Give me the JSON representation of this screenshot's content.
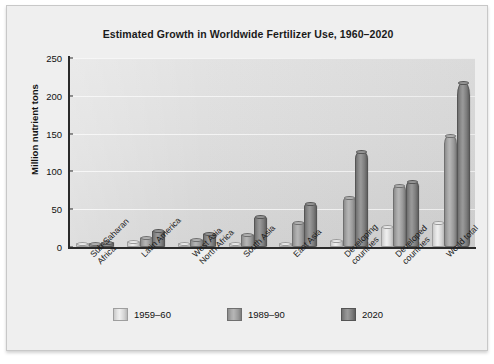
{
  "chart_data": {
    "type": "bar",
    "title": "Estimated Growth in Worldwide Fertilizer Use, 1960–2020",
    "xlabel": "",
    "ylabel": "Million nutrient tons",
    "ylim": [
      0,
      250
    ],
    "yticks": [
      0,
      50,
      100,
      150,
      200,
      250
    ],
    "grid": true,
    "legend_position": "bottom",
    "categories": [
      "Sub-Saharan\nAfrica",
      "Latin America",
      "West Asia\nNorth Africa",
      "South Asia",
      "East Asia",
      "Developing\ncountries",
      "Developed\ncountries",
      "World total"
    ],
    "series": [
      {
        "name": "1959–60",
        "color": "#e6e6e6",
        "values": [
          1,
          5,
          2,
          2,
          3,
          6,
          25,
          30
        ]
      },
      {
        "name": "1989–90",
        "color": "#a8a8a8",
        "values": [
          2,
          10,
          8,
          15,
          30,
          63,
          80,
          145
        ]
      },
      {
        "name": "2020",
        "color": "#808080",
        "values": [
          4,
          20,
          16,
          38,
          55,
          125,
          85,
          215
        ]
      }
    ]
  },
  "axis": {
    "ytick_labels": [
      "250",
      "200",
      "150",
      "100",
      "50",
      "0"
    ]
  },
  "legend": {
    "items": [
      {
        "label": "1959–60"
      },
      {
        "label": "1989–90"
      },
      {
        "label": "2020"
      }
    ]
  }
}
